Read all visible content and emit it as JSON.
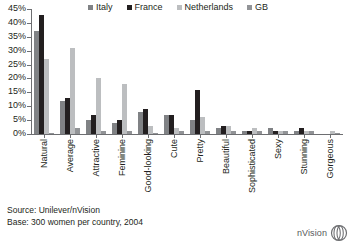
{
  "chart_data": {
    "type": "bar",
    "title": "",
    "subtitle": "",
    "xlabel": "",
    "ylabel": "",
    "ylim": [
      0,
      45
    ],
    "ytick_values": [
      0,
      5,
      10,
      15,
      20,
      25,
      30,
      35,
      40,
      45
    ],
    "ytick_labels": [
      "0%",
      "5%",
      "10%",
      "15%",
      "20%",
      "25%",
      "30%",
      "35%",
      "40%",
      "45%"
    ],
    "grid": false,
    "legend_position": "top",
    "categories": [
      "Natural",
      "Average",
      "Attractive",
      "Feminine",
      "Good-looking",
      "Cute",
      "Pretty",
      "Beautiful",
      "Sophisticated",
      "Sexy",
      "Stunning",
      "Gorgeous"
    ],
    "series": [
      {
        "name": "Italy",
        "color": "#808285",
        "values": [
          37,
          12,
          5,
          4,
          8,
          7,
          5,
          2,
          1,
          2,
          1,
          0
        ]
      },
      {
        "name": "France",
        "color": "#231f20",
        "values": [
          43,
          13,
          7,
          5,
          9,
          7,
          16,
          3,
          1,
          1,
          2,
          0
        ]
      },
      {
        "name": "Netherlands",
        "color": "#bcbec0",
        "values": [
          27,
          31,
          20,
          18,
          3,
          2,
          6,
          3,
          2,
          1,
          1,
          1
        ]
      },
      {
        "name": "GB",
        "color": "#929497",
        "values": [
          0.4,
          2,
          1,
          1,
          0.5,
          1,
          1,
          1,
          1,
          1,
          1,
          0.5
        ]
      }
    ]
  },
  "legend": {
    "items": [
      {
        "label": "Italy",
        "color": "#808285"
      },
      {
        "label": "France",
        "color": "#231f20"
      },
      {
        "label": "Netherlands",
        "color": "#bcbec0"
      },
      {
        "label": "GB",
        "color": "#929497"
      }
    ]
  },
  "footer": {
    "source_line": "Source: Unilever/nVision",
    "base_line": "Base: 300 women per country, 2004"
  },
  "brand": {
    "name": "nVision",
    "mark": "nvision-logo-icon"
  }
}
